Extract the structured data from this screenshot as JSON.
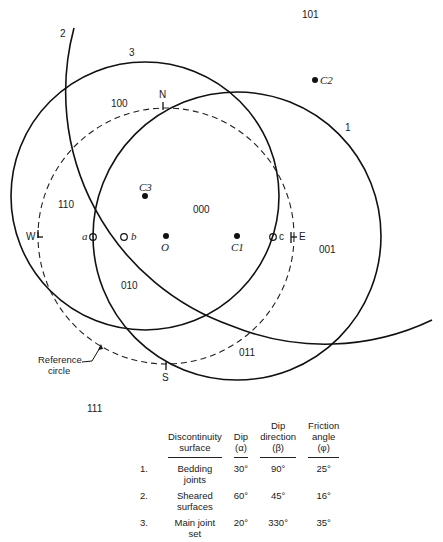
{
  "diagram": {
    "type": "stereographic projection of discontinuity planes",
    "reference_circle": {
      "label_line1": "Reference",
      "label_line2": "circle"
    },
    "compass": {
      "north": "N",
      "south": "S",
      "east": "E",
      "west": "W"
    },
    "great_circles": [
      {
        "id": "1",
        "label": "1",
        "center_label": "C1"
      },
      {
        "id": "2",
        "label": "2",
        "center_label": "C2"
      },
      {
        "id": "3",
        "label": "3",
        "center_label": "C3"
      }
    ],
    "points": {
      "origin": "O",
      "a": "a",
      "b": "b",
      "c": "c"
    },
    "regions": {
      "r000": "000",
      "r001": "001",
      "r010": "010",
      "r011": "011",
      "r100": "100",
      "r101": "101",
      "r110": "110",
      "r111": "111"
    }
  },
  "table": {
    "headers": {
      "surface_l1": "Discontinuity",
      "surface_l2": "surface",
      "dip_l1": "Dip",
      "dip_l2": "(α)",
      "dipdir_l1": "Dip",
      "dipdir_l2": "direction",
      "dipdir_l3": "(β)",
      "friction_l1": "Friction",
      "friction_l2": "angle",
      "friction_l3": "(φ)"
    },
    "rows": [
      {
        "num": "1.",
        "surface_l1": "Bedding",
        "surface_l2": "joints",
        "dip": "30°",
        "dip_direction": "90°",
        "friction": "25°"
      },
      {
        "num": "2.",
        "surface_l1": "Sheared",
        "surface_l2": "surfaces",
        "dip": "60°",
        "dip_direction": "45°",
        "friction": "16°"
      },
      {
        "num": "3.",
        "surface_l1": "Main joint",
        "surface_l2": "set",
        "dip": "20°",
        "dip_direction": "330°",
        "friction": "35°"
      }
    ]
  }
}
